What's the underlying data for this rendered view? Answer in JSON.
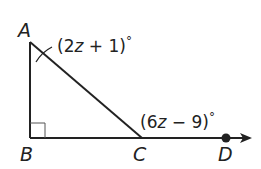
{
  "diagram": {
    "points": {
      "A": {
        "label": "A"
      },
      "B": {
        "label": "B"
      },
      "C": {
        "label": "C"
      },
      "D": {
        "label": "D"
      }
    },
    "angles": {
      "A": {
        "expr_pre": "(2",
        "var": "z",
        "expr_post": " + 1)",
        "deg": "°"
      },
      "C_exterior": {
        "expr_pre": "(6",
        "var": "z",
        "expr_post": " − 9)",
        "deg": "°"
      }
    },
    "right_angle_at": "B",
    "colors": {
      "line": "#222222"
    }
  }
}
